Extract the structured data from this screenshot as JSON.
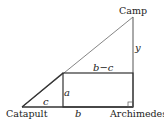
{
  "diagram": {
    "points": {
      "catapult": {
        "label": "Catapult",
        "x": 22,
        "y": 107
      },
      "archimedes": {
        "label": "Archimedes",
        "x": 133,
        "y": 107
      },
      "camp": {
        "label": "Camp",
        "x": 133,
        "y": 17
      },
      "rect_corner": {
        "x": 63,
        "y": 73
      }
    },
    "variables": {
      "a": "a",
      "b": "b",
      "c": "c",
      "y": "y",
      "b_minus_c": "b−c"
    },
    "colors": {
      "line": "#333333",
      "hypotenuse": "#555555",
      "background": "#ffffff"
    }
  }
}
